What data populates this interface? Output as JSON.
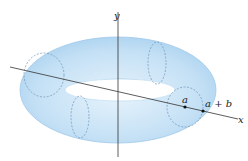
{
  "figure": {
    "axes": {
      "x_label": "x",
      "y_label": "y"
    },
    "points": [
      {
        "label": "a"
      },
      {
        "label": "a + b"
      }
    ],
    "colors": {
      "torus_fill": "#bcdcf3",
      "torus_edge": "#8fbfe3",
      "cross_section_dash": "#6b93b8",
      "axis": "#333333"
    }
  }
}
